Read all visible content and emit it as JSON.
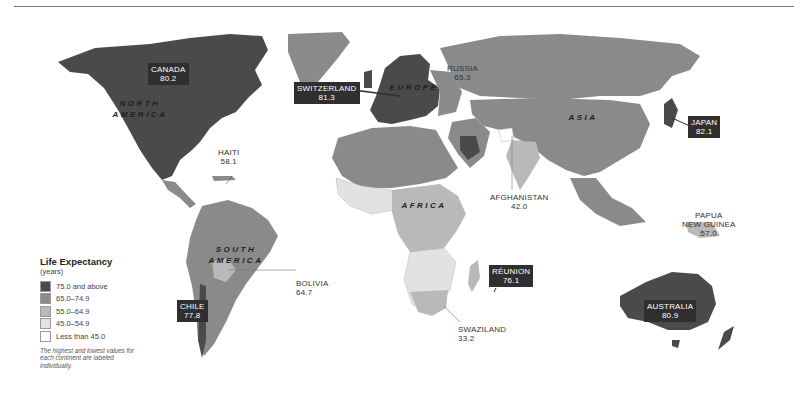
{
  "legend": {
    "title": "Life Expectancy",
    "subtitle": "(years)",
    "items": [
      {
        "label": "75.0 and above",
        "color": "#4a4a4a"
      },
      {
        "label": "65.0–74.9",
        "color": "#8a8a8a"
      },
      {
        "label": "55.0–64.9",
        "color": "#b9b9b9"
      },
      {
        "label": "45.0–54.9",
        "color": "#e2e2e2"
      },
      {
        "label": "Less than 45.0",
        "color": "#ffffff"
      }
    ],
    "note": "The highest and lowest values for each continent are labeled individually."
  },
  "continents": {
    "north_america": {
      "line1": "NORTH",
      "line2": "AMERICA"
    },
    "south_america": {
      "line1": "SOUTH",
      "line2": "AMERICA"
    },
    "europe": "EUROPE",
    "africa": "AFRICA",
    "asia": "ASIA"
  },
  "callouts": {
    "canada": {
      "name": "CANADA",
      "value": "80.2"
    },
    "haiti": {
      "name": "HAITI",
      "value": "58.1"
    },
    "switzerland": {
      "name": "SWITZERLAND",
      "value": "81.3"
    },
    "russia": {
      "name": "RUSSIA",
      "value": "65.3"
    },
    "japan": {
      "name": "JAPAN",
      "value": "82.1"
    },
    "afghanistan": {
      "name": "AFGHANISTAN",
      "value": "42.0"
    },
    "papua": {
      "name1": "PAPUA",
      "name2": "NEW GUINEA",
      "value": "57.0"
    },
    "bolivia": {
      "name": "BOLIVIA",
      "value": "64.7"
    },
    "chile": {
      "name": "CHILE",
      "value": "77.8"
    },
    "reunion": {
      "name": "RÉUNION",
      "value": "76.1"
    },
    "swaziland": {
      "name": "SWAZILAND",
      "value": "33.2"
    },
    "australia": {
      "name": "AUSTRALIA",
      "value": "80.9"
    }
  },
  "colors": {
    "c75": "#4a4a4a",
    "c65": "#8a8a8a",
    "c55": "#b9b9b9",
    "c45": "#e2e2e2",
    "clt45": "#ffffff",
    "label_box": "#2f2f2f"
  }
}
